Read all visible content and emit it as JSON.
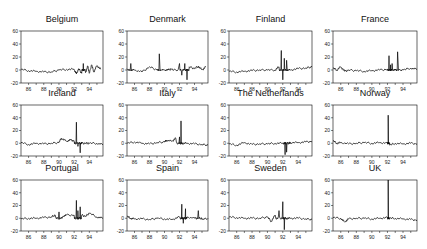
{
  "figure": {
    "layout": {
      "rows": 3,
      "cols": 4
    },
    "line_color": "#000000",
    "frame_color": "#000000"
  },
  "chart_data": {
    "type": "line",
    "title": "",
    "xlabel": "",
    "ylabel": "",
    "xlim": [
      85,
      95.8
    ],
    "ylim": [
      -20,
      60
    ],
    "x_ticks": [
      86,
      88,
      90,
      92,
      94
    ],
    "x_tick_labels": [
      "86",
      "88",
      "90",
      "92",
      "94"
    ],
    "y_ticks": [
      -20,
      0,
      20,
      40,
      60
    ],
    "y_tick_labels": [
      "-20",
      "0",
      "20",
      "40",
      "60"
    ],
    "grid": false,
    "legend": null,
    "panels": [
      {
        "name": "Belgium",
        "x": [
          85,
          86,
          87,
          88,
          89,
          90,
          91,
          92,
          92.3,
          92.6,
          93,
          93.2,
          93.5,
          93.8,
          94,
          94.3,
          94.6,
          95,
          95.5
        ],
        "y": [
          1,
          -1,
          -2,
          -3,
          -3,
          0,
          1,
          1,
          -6,
          2,
          -5,
          10,
          -4,
          6,
          -5,
          8,
          -3,
          7,
          1
        ]
      },
      {
        "name": "Denmark",
        "x": [
          85,
          85.5,
          86,
          87,
          88,
          89,
          89.3,
          90,
          90.5,
          91,
          92,
          92.3,
          92.7,
          93,
          93.3,
          94,
          94.5,
          95,
          95.5
        ],
        "y": [
          2,
          10,
          0,
          -3,
          5,
          0,
          25,
          0,
          0,
          2,
          10,
          -8,
          10,
          -15,
          5,
          2,
          6,
          0,
          5
        ]
      },
      {
        "name": "Finland",
        "x": [
          85,
          86,
          87,
          88,
          89,
          90,
          91,
          91.5,
          91.8,
          92,
          92.2,
          92.5,
          93,
          94,
          95,
          95.8
        ],
        "y": [
          -2,
          -3,
          -2,
          -1,
          0,
          0,
          0,
          5,
          30,
          -15,
          18,
          15,
          0,
          2,
          3,
          5
        ]
      },
      {
        "name": "France",
        "x": [
          85,
          85.5,
          86,
          86.5,
          87,
          88,
          89,
          90,
          91,
          92,
          92.2,
          92.4,
          92.6,
          93,
          93.3,
          94,
          95,
          95.8
        ],
        "y": [
          3,
          0,
          5,
          -2,
          0,
          -1,
          -2,
          -1,
          0,
          1,
          22,
          8,
          10,
          0,
          28,
          0,
          3,
          1
        ]
      },
      {
        "name": "Ireland",
        "x": [
          85,
          86,
          87,
          88,
          89,
          90,
          90.3,
          91,
          91.5,
          92,
          92.3,
          92.5,
          92.8,
          93,
          93.5,
          94,
          95,
          95.8
        ],
        "y": [
          1,
          -2,
          0,
          -1,
          0,
          1,
          8,
          3,
          5,
          4,
          33,
          -5,
          -15,
          0,
          0,
          0,
          0,
          -2
        ]
      },
      {
        "name": "Italy",
        "x": [
          85,
          86,
          87,
          88,
          89,
          90,
          90.3,
          91,
          91.5,
          92,
          92.2,
          92.4,
          93,
          94,
          95,
          95.8
        ],
        "y": [
          0,
          2,
          0,
          -1,
          1,
          2,
          5,
          3,
          8,
          10,
          35,
          0,
          0,
          -1,
          -2,
          -3
        ]
      },
      {
        "name": "The Netherlands",
        "x": [
          85,
          86,
          87,
          88,
          89,
          90,
          91,
          92,
          92.3,
          92.5,
          92.8,
          93,
          94,
          95,
          95.8
        ],
        "y": [
          -1,
          -3,
          1,
          -2,
          -1,
          -1,
          0,
          0,
          -18,
          -14,
          0,
          1,
          1,
          2,
          3
        ]
      },
      {
        "name": "Norway",
        "x": [
          85,
          85.5,
          86,
          87,
          88,
          89,
          90,
          91,
          92,
          92.1,
          92.3,
          93,
          94,
          95,
          95.8
        ],
        "y": [
          4,
          0,
          1,
          -1,
          0,
          1,
          0,
          1,
          0,
          44,
          -3,
          0,
          -1,
          0,
          -1
        ]
      },
      {
        "name": "Portugal",
        "x": [
          85,
          86,
          87,
          88,
          89,
          89.5,
          90,
          90.5,
          91,
          92,
          92.3,
          92.5,
          92.8,
          93,
          93.5,
          94,
          95,
          95.8
        ],
        "y": [
          -1,
          0,
          0,
          1,
          2,
          5,
          10,
          3,
          5,
          5,
          28,
          12,
          18,
          5,
          3,
          8,
          2,
          0
        ]
      },
      {
        "name": "Spain",
        "x": [
          85,
          85.5,
          86,
          87,
          88,
          89,
          90,
          91,
          92,
          92.3,
          92.5,
          92.8,
          93,
          94,
          94.5,
          95,
          95.8
        ],
        "y": [
          3,
          0,
          -1,
          -1,
          -2,
          0,
          -1,
          -2,
          2,
          22,
          -8,
          15,
          2,
          0,
          12,
          -2,
          0
        ]
      },
      {
        "name": "Sweden",
        "x": [
          85,
          86,
          87,
          88,
          89,
          90,
          90.5,
          91,
          91.5,
          92,
          92.2,
          92.5,
          93,
          94,
          95,
          95.8
        ],
        "y": [
          2,
          1,
          0,
          0,
          0,
          2,
          -5,
          5,
          12,
          26,
          -18,
          0,
          0,
          0,
          -1,
          -2
        ]
      },
      {
        "name": "UK",
        "x": [
          85,
          86,
          86.5,
          87,
          88,
          89,
          90,
          91,
          92,
          92.1,
          92.3,
          93,
          94,
          95,
          95.8
        ],
        "y": [
          1,
          0,
          -6,
          -1,
          0,
          0,
          -1,
          0,
          1,
          60,
          0,
          0,
          -1,
          -2,
          -3
        ]
      }
    ]
  }
}
